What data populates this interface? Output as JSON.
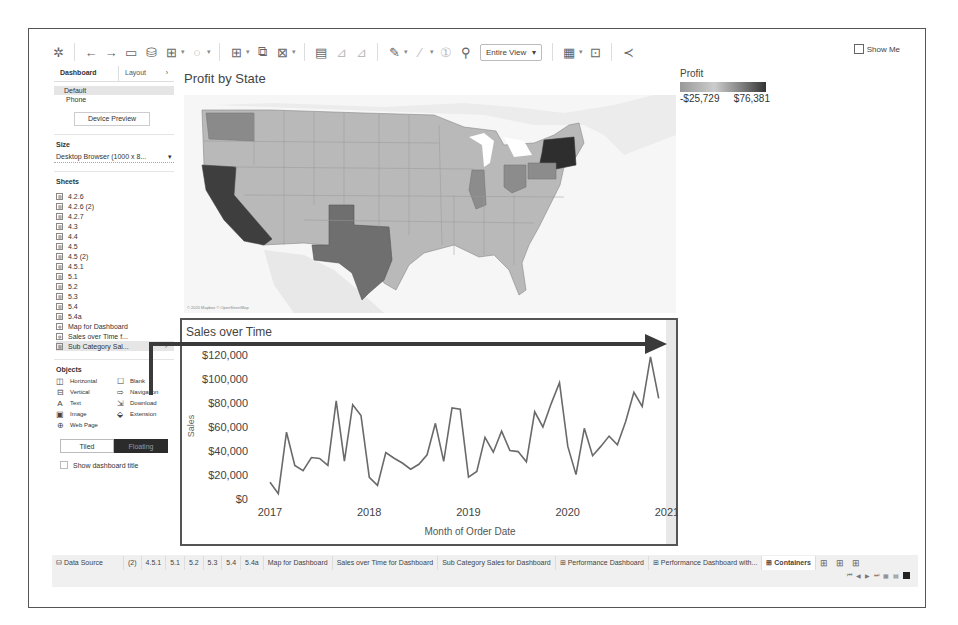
{
  "toolbar": {
    "fit_dropdown": "Entire View",
    "show_me_label": "Show Me",
    "icons": [
      "tableau-logo-icon",
      "undo-icon",
      "redo-icon",
      "save-icon",
      "new-datasource-icon",
      "new-sheet-icon",
      "refresh-icon",
      "swap-icon",
      "duplicate-icon",
      "clear-icon",
      "highlight-icon",
      "sort-asc-icon",
      "sort-desc-icon",
      "label-icon",
      "format-icon",
      "fix-axes-icon",
      "pin-icon",
      "presentation-icon",
      "device-icon",
      "share-icon"
    ]
  },
  "left_panel": {
    "tabs": [
      {
        "label": "Dashboard",
        "active": true
      },
      {
        "label": "Layout",
        "active": false
      }
    ],
    "devices": [
      {
        "label": "Default",
        "selected": true
      },
      {
        "label": "Phone",
        "selected": false
      }
    ],
    "device_preview_label": "Device Preview",
    "size_title": "Size",
    "size_value": "Desktop Browser (1000 x 8...",
    "sheets_title": "Sheets",
    "sheets": [
      {
        "label": "4.2.6"
      },
      {
        "label": "4.2.6 (2)"
      },
      {
        "label": "4.2.7"
      },
      {
        "label": "4.3"
      },
      {
        "label": "4.4"
      },
      {
        "label": "4.5"
      },
      {
        "label": "4.5 (2)"
      },
      {
        "label": "4.5.1"
      },
      {
        "label": "5.1"
      },
      {
        "label": "5.2"
      },
      {
        "label": "5.3"
      },
      {
        "label": "5.4"
      },
      {
        "label": "5.4a"
      },
      {
        "label": "Map for Dashboard"
      },
      {
        "label": "Sales over Time f..."
      },
      {
        "label": "Sub Category Sal...",
        "selected": true
      }
    ],
    "objects_title": "Objects",
    "objects": [
      {
        "label": "Horizontal",
        "icon": "horizontal-container-icon",
        "glyph": "◫"
      },
      {
        "label": "Blank",
        "icon": "blank-icon",
        "glyph": "☐"
      },
      {
        "label": "Vertical",
        "icon": "vertical-container-icon",
        "glyph": "⊟"
      },
      {
        "label": "Navigation",
        "icon": "navigation-icon",
        "glyph": "⇨"
      },
      {
        "label": "Text",
        "icon": "text-icon",
        "glyph": "A"
      },
      {
        "label": "Download",
        "icon": "download-icon",
        "glyph": "⇲"
      },
      {
        "label": "Image",
        "icon": "image-icon",
        "glyph": "▣"
      },
      {
        "label": "Extension",
        "icon": "extension-icon",
        "glyph": "⬙"
      },
      {
        "label": "Web Page",
        "icon": "web-page-icon",
        "glyph": "⊕"
      }
    ],
    "tiled_label": "Tiled",
    "floating_label": "Floating",
    "show_title_label": "Show dashboard title"
  },
  "map": {
    "title": "Profit by State",
    "attribution": "© 2020 Mapbox © OpenStreetMap",
    "label_mexico": "Mexico",
    "legend": {
      "title": "Profit",
      "min": "-$25,729",
      "max": "$76,381"
    }
  },
  "chart_data": {
    "type": "line",
    "title": "Sales over Time",
    "xlabel": "Month of Order Date",
    "ylabel": "Sales",
    "x_ticks": [
      "2017",
      "2018",
      "2019",
      "2020",
      "2021"
    ],
    "y_ticks": [
      "$0",
      "$20,000",
      "$40,000",
      "$60,000",
      "$80,000",
      "$100,000",
      "$120,000"
    ],
    "ylim": [
      0,
      120000
    ],
    "grid": false,
    "x": [
      "2017-01",
      "2017-02",
      "2017-03",
      "2017-04",
      "2017-05",
      "2017-06",
      "2017-07",
      "2017-08",
      "2017-09",
      "2017-10",
      "2017-11",
      "2017-12",
      "2018-01",
      "2018-02",
      "2018-03",
      "2018-04",
      "2018-05",
      "2018-06",
      "2018-07",
      "2018-08",
      "2018-09",
      "2018-10",
      "2018-11",
      "2018-12",
      "2019-01",
      "2019-02",
      "2019-03",
      "2019-04",
      "2019-05",
      "2019-06",
      "2019-07",
      "2019-08",
      "2019-09",
      "2019-10",
      "2019-11",
      "2019-12",
      "2020-01",
      "2020-02",
      "2020-03",
      "2020-04",
      "2020-05",
      "2020-06",
      "2020-07",
      "2020-08",
      "2020-09",
      "2020-10",
      "2020-11",
      "2020-12"
    ],
    "series": [
      {
        "name": "Sales",
        "values": [
          14000,
          4500,
          55700,
          28000,
          23600,
          34600,
          33800,
          28000,
          81800,
          31500,
          78600,
          69500,
          18000,
          11300,
          38700,
          34000,
          30000,
          24800,
          28900,
          36800,
          63100,
          31400,
          75900,
          74900,
          18200,
          23000,
          51300,
          39000,
          56600,
          40300,
          39500,
          31000,
          72700,
          60000,
          79500,
          96900,
          43800,
          20300,
          58900,
          36100,
          43800,
          52400,
          45200,
          64400,
          88900,
          77200,
          118400,
          83800
        ]
      }
    ]
  },
  "bottom_tabs": {
    "data_source_label": "Data Source",
    "tabs": [
      {
        "label": "(2)"
      },
      {
        "label": "4.5.1"
      },
      {
        "label": "5.1"
      },
      {
        "label": "5.2"
      },
      {
        "label": "5.3"
      },
      {
        "label": "5.4"
      },
      {
        "label": "5.4a"
      },
      {
        "label": "Map for Dashboard"
      },
      {
        "label": "Sales over Time for Dashboard"
      },
      {
        "label": "Sub Category Sales for Dashboard"
      },
      {
        "label": "Performance Dashboard",
        "dashboard": true
      },
      {
        "label": "Performance Dashboard with...",
        "dashboard": true
      },
      {
        "label": "Containers",
        "dashboard": true,
        "active": true
      }
    ]
  }
}
